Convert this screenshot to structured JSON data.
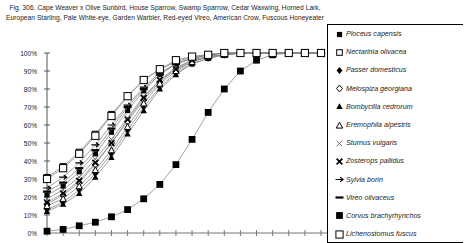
{
  "figure": {
    "caption": "Fig. 306.  Cape Weaver x Olive Sunbird, House Sparrow, Swamp Sparrow, Cedar Waxwing, Horned Lark, European Starling, Pale White-eye, Garden Warbler, Red-eyed Vireo, American Crow, Fuscous Honeyeater"
  },
  "chart_data": {
    "type": "line",
    "title": "Fig. 306.  Cape Weaver x Olive Sunbird, House Sparrow, Swamp Sparrow, Cedar Waxwing, Horned Lark, European Starling, Pale White-eye, Garden Warbler, Red-eyed Vireo, American Crow, Fuscous Honeyeater",
    "xlabel": "",
    "ylabel": "",
    "ylim": [
      0,
      100
    ],
    "ytick_labels": [
      "0%",
      "10%",
      "20%",
      "30%",
      "40%",
      "50%",
      "60%",
      "70%",
      "80%",
      "90%",
      "100%"
    ],
    "ytick_values": [
      0,
      10,
      20,
      30,
      40,
      50,
      60,
      70,
      80,
      90,
      100
    ],
    "xtick_labels": [
      "",
      "",
      "",
      "",
      "",
      "",
      "",
      "",
      "",
      "",
      "",
      "",
      "",
      "",
      "",
      "",
      "",
      ""
    ],
    "x": [
      0,
      1,
      2,
      3,
      4,
      5,
      6,
      7,
      8,
      9,
      10,
      11,
      12,
      13,
      14,
      15,
      16,
      17
    ],
    "grid": false,
    "legend_position": "right",
    "series": [
      {
        "name": "Ploceus capensis",
        "marker": "filled-square",
        "values": [
          21,
          26,
          34,
          44,
          56,
          68,
          79,
          88,
          94,
          97,
          99,
          100,
          100,
          100,
          100,
          100,
          100,
          100
        ]
      },
      {
        "name": "Nectarinia olivacea",
        "marker": "open-square",
        "values": [
          31,
          37,
          45,
          55,
          66,
          76,
          85,
          91,
          95,
          98,
          99,
          100,
          100,
          100,
          100,
          100,
          100,
          100
        ]
      },
      {
        "name": "Passer domesticus",
        "marker": "filled-diamond",
        "values": [
          13,
          17,
          24,
          33,
          44,
          57,
          70,
          81,
          89,
          94,
          97,
          99,
          100,
          100,
          100,
          100,
          100,
          100
        ]
      },
      {
        "name": "Melospiza georgiana",
        "marker": "open-diamond",
        "values": [
          16,
          21,
          28,
          38,
          50,
          62,
          74,
          84,
          91,
          95,
          98,
          99,
          100,
          100,
          100,
          100,
          100,
          100
        ]
      },
      {
        "name": "Bombycilla cedrorum",
        "marker": "filled-triangle",
        "values": [
          12,
          16,
          22,
          31,
          42,
          55,
          68,
          80,
          88,
          94,
          97,
          99,
          100,
          100,
          100,
          100,
          100,
          100
        ]
      },
      {
        "name": "Eremophila alpestris",
        "marker": "open-triangle",
        "values": [
          15,
          19,
          26,
          35,
          46,
          59,
          72,
          83,
          90,
          95,
          98,
          99,
          100,
          100,
          100,
          100,
          100,
          100
        ]
      },
      {
        "name": "Sturnus vulgaris",
        "marker": "x-thin",
        "values": [
          19,
          24,
          31,
          41,
          52,
          64,
          76,
          85,
          92,
          96,
          98,
          99,
          100,
          100,
          100,
          100,
          100,
          100
        ]
      },
      {
        "name": "Zosterops pallidus",
        "marker": "x-bold",
        "values": [
          17,
          22,
          29,
          39,
          50,
          63,
          75,
          85,
          91,
          96,
          98,
          99,
          100,
          100,
          100,
          100,
          100,
          100
        ]
      },
      {
        "name": "Sylvia borin",
        "marker": "dash-arrow",
        "values": [
          25,
          31,
          39,
          49,
          60,
          71,
          81,
          89,
          94,
          97,
          99,
          100,
          100,
          100,
          100,
          100,
          100,
          100
        ]
      },
      {
        "name": "Vireo olivaceus",
        "marker": "dash",
        "values": [
          23,
          28,
          36,
          46,
          58,
          70,
          80,
          88,
          94,
          97,
          99,
          100,
          100,
          100,
          100,
          100,
          100,
          100
        ]
      },
      {
        "name": "Corvus brachyrhynchos",
        "marker": "filled-square-large",
        "values": [
          1,
          2,
          4,
          6,
          9,
          13,
          19,
          27,
          38,
          52,
          67,
          80,
          90,
          96,
          99,
          100,
          100,
          100
        ]
      },
      {
        "name": "Lichenostomus fuscus",
        "marker": "open-square-large",
        "values": [
          30,
          36,
          44,
          54,
          65,
          76,
          85,
          91,
          96,
          98,
          99,
          100,
          100,
          100,
          100,
          100,
          100,
          100
        ]
      }
    ]
  }
}
